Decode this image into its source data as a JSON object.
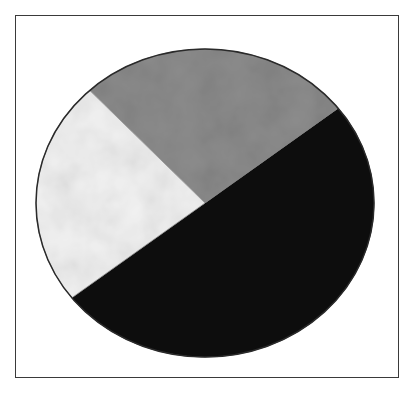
{
  "chart_data": {
    "type": "pie",
    "title": "",
    "subtitle": "",
    "legend": [],
    "labels_visible": false,
    "slices": [
      {
        "name": "black",
        "value": 50,
        "color": "#0a0a0a",
        "start_deg": 218,
        "end_deg": 398
      },
      {
        "name": "gray",
        "value": 26,
        "color": "#8c8c8c",
        "start_deg": 38,
        "end_deg": 133
      },
      {
        "name": "white",
        "value": 24,
        "color": "#f2f2f2",
        "start_deg": 133,
        "end_deg": 218
      }
    ],
    "categories": [
      "black",
      "gray",
      "white"
    ],
    "values": [
      50,
      26,
      24
    ],
    "unit": "percent (estimated from slice angles)"
  },
  "colors": {
    "frame_border": "#3a3a3a",
    "background": "#ffffff",
    "outline": "#2a2a2a"
  },
  "geometry": {
    "cx": 205,
    "cy": 203,
    "rx": 169,
    "ry": 154
  }
}
